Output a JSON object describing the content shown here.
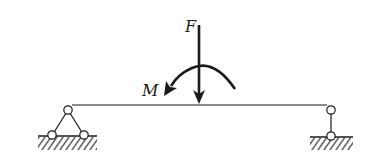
{
  "diagram": {
    "type": "simply-supported-beam",
    "colors": {
      "stroke": "#1a1a1a",
      "background": "#ffffff"
    },
    "beam": {
      "x1": 68,
      "x2": 331,
      "y": 105
    },
    "force": {
      "label": "F",
      "direction": "down",
      "x": 199
    },
    "moment": {
      "label": "M",
      "direction": "counterclockwise"
    },
    "supports": [
      {
        "position": "left",
        "kind": "fixed-pin-triangle"
      },
      {
        "position": "right",
        "kind": "roller-link"
      }
    ]
  }
}
